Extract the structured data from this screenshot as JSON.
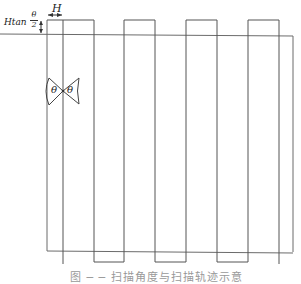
{
  "diagram": {
    "labels": {
      "width_label": "H",
      "offset_label_prefix": "Htan",
      "offset_label_frac_num": "θ",
      "offset_label_frac_den": "2",
      "angle_left": "θ",
      "angle_right": "θ"
    },
    "caption": "图 ─ ─ 扫描角度与扫描轨迹示意",
    "colors": {
      "stroke": "#555555",
      "background": "#ffffff"
    },
    "frame": {
      "x": 47,
      "y": 34,
      "right": 293,
      "bottom": 252
    },
    "square_wave": {
      "top_y": 20,
      "bottom_y": 262,
      "vertical_x": [
        63,
        94,
        125,
        155,
        186,
        217,
        248,
        278
      ],
      "top_pulses": [
        [
          63,
          94
        ],
        [
          125,
          155
        ],
        [
          187,
          217
        ],
        [
          248,
          279
        ]
      ],
      "bottom_pulses": [
        [
          94,
          124
        ],
        [
          155,
          186
        ],
        [
          217,
          248
        ]
      ]
    }
  }
}
